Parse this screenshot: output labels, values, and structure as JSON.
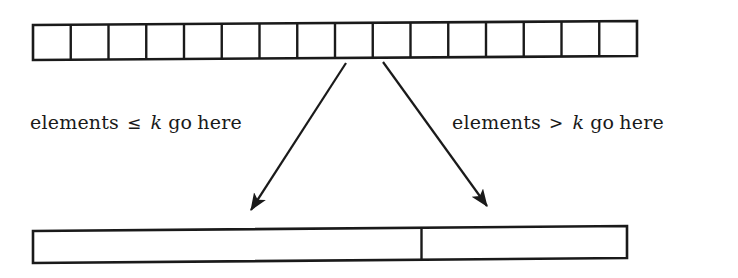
{
  "figure": {
    "background_color": "#ffffff",
    "ink_color": "#1a1a1a"
  },
  "top_array": {
    "name": "unpartitioned-array",
    "cell_count": 16,
    "left": 33,
    "right": 637,
    "top": 22,
    "bottom": 59,
    "cells": [
      "",
      "",
      "",
      "",
      "",
      "",
      "",
      "",
      "",
      "",
      "",
      "",
      "",
      "",
      "",
      ""
    ]
  },
  "arrows": [
    {
      "name": "arrow-to-left-partition",
      "from_x": 346,
      "from_y": 63,
      "to_x": 249,
      "to_y": 213
    },
    {
      "name": "arrow-to-right-partition",
      "from_x": 383,
      "from_y": 62,
      "to_x": 489,
      "to_y": 209
    }
  ],
  "labels": {
    "left": {
      "full_text": "elements ≤ k go here",
      "word_1": "elements",
      "relation": "≤",
      "variable": "k",
      "word_2": "go",
      "word_3": "here"
    },
    "right": {
      "full_text": "elements > k go here",
      "word_1": "elements",
      "relation": ">",
      "variable": "k",
      "word_2": "go",
      "word_3": "here"
    }
  },
  "bottom_bar": {
    "name": "partitioned-array",
    "left": 33,
    "right": 627,
    "divider_x": 421,
    "top": 227,
    "bottom": 261,
    "segments": [
      {
        "name": "left-partition-segment",
        "label": ""
      },
      {
        "name": "right-partition-segment",
        "label": ""
      }
    ]
  }
}
